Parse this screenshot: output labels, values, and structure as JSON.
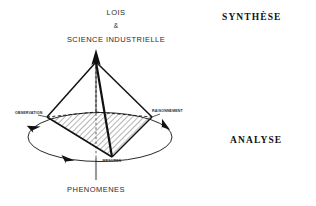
{
  "figure": {
    "title_block": {
      "line1": "LOIS",
      "line2": "&",
      "line3": "SCIENCE INDUSTRIELLE"
    },
    "bottom_label": "PHENOMENES",
    "side_labels": {
      "top": "SYNTHÈSE",
      "bottom": "ANALYSE"
    },
    "vertex_labels": {
      "left": "OBSERVATION",
      "right": "RAISONNEMENT",
      "bottom_center": "MESURES"
    },
    "colors": {
      "stroke": "#111111",
      "axis_grey": "#9a9a9a",
      "hatch": "#2b2b2b",
      "background": "#ffffff",
      "text": "#2b2b2b"
    },
    "geometry": {
      "apex": [
        96,
        62
      ],
      "left_vertex": [
        47,
        117
      ],
      "right_vertex": [
        152,
        117
      ],
      "front_vertex": [
        112,
        157
      ],
      "back_vertex": [
        96,
        112
      ],
      "ellipse_center": [
        100,
        137
      ],
      "ellipse_rx": 72,
      "ellipse_ry": 25
    },
    "arrows": {
      "apex_direction": "up",
      "ellipse_rotation": "clockwise",
      "count": 3
    }
  }
}
